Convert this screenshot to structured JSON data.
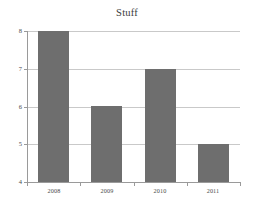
{
  "chart_data": {
    "type": "bar",
    "title": "Stuff",
    "xlabel": "",
    "ylabel": "",
    "categories": [
      "2008",
      "2009",
      "2010",
      "2011"
    ],
    "values": [
      8,
      6,
      7,
      5
    ],
    "ylim": [
      4,
      8
    ],
    "yticks": [
      4,
      5,
      6,
      7,
      8
    ],
    "ytick_labels": [
      "4",
      "5",
      "6",
      "7",
      "8"
    ],
    "grid": true,
    "grid_axis": "y",
    "legend": false,
    "legend_position": "none",
    "bar_color": "#6e6e6e",
    "background_color": "#ffffff",
    "gridline_color": "#c9c9c9",
    "axis_color": "#9a9a9a",
    "title_color": "#3b3b3b",
    "tick_label_color": "#4a4a4a"
  }
}
